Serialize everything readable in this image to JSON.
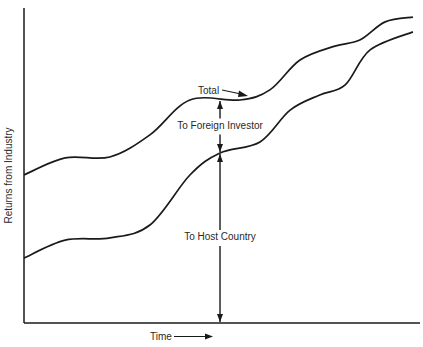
{
  "chart_data": {
    "type": "line",
    "title": "",
    "xlabel": "Time",
    "ylabel": "Returns from Industry",
    "xlim": [
      0,
      100
    ],
    "ylim": [
      0,
      100
    ],
    "grid": false,
    "ticks": false,
    "series": [
      {
        "name": "Total",
        "x": [
          0,
          10.4,
          21.7,
          31.8,
          41.9,
          54.5,
          62.1,
          69.7,
          78.5,
          84.8,
          91.2,
          98.2
        ],
        "y": [
          47,
          52.4,
          52.7,
          59.7,
          70.8,
          70.8,
          74,
          83.5,
          87.9,
          89.8,
          95.6,
          97.1
        ]
      },
      {
        "name": "To Host Country",
        "x": [
          0,
          10.4,
          21.7,
          31.8,
          41.9,
          49.5,
          59.6,
          67.2,
          74.7,
          81.1,
          87.4,
          98.2
        ],
        "y": [
          20.6,
          26.3,
          27,
          31.1,
          47,
          54,
          57.5,
          67.6,
          72.4,
          75.6,
          86.7,
          92.4
        ]
      }
    ],
    "annotations": {
      "total_label": "Total",
      "foreign_label": "To Foreign Investor",
      "host_label": "To Host Country",
      "marker_x": 49.5,
      "total_at_marker": 70.8,
      "host_at_marker": 54
    },
    "color": "#1a1a1a"
  }
}
